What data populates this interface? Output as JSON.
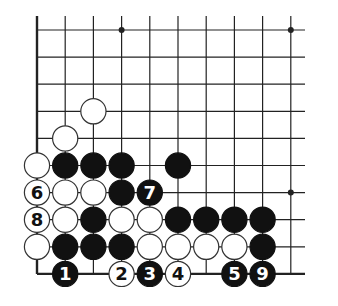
{
  "diagram": {
    "type": "go-board-fragment",
    "columns": 10,
    "rows": 10,
    "edges": {
      "left": true,
      "bottom": true,
      "top": false,
      "right": false
    },
    "star_points": [
      [
        3,
        0
      ],
      [
        9,
        0
      ],
      [
        9,
        6
      ]
    ],
    "stones": [
      {
        "color": "white",
        "col": 2,
        "row": 3,
        "label": ""
      },
      {
        "color": "white",
        "col": 1,
        "row": 4,
        "label": ""
      },
      {
        "color": "white",
        "col": 0,
        "row": 5,
        "label": ""
      },
      {
        "color": "black",
        "col": 1,
        "row": 5,
        "label": ""
      },
      {
        "color": "black",
        "col": 2,
        "row": 5,
        "label": ""
      },
      {
        "color": "black",
        "col": 3,
        "row": 5,
        "label": ""
      },
      {
        "color": "black",
        "col": 5,
        "row": 5,
        "label": ""
      },
      {
        "color": "white",
        "col": 0,
        "row": 6,
        "label": "6"
      },
      {
        "color": "white",
        "col": 1,
        "row": 6,
        "label": ""
      },
      {
        "color": "white",
        "col": 2,
        "row": 6,
        "label": ""
      },
      {
        "color": "black",
        "col": 3,
        "row": 6,
        "label": ""
      },
      {
        "color": "black",
        "col": 4,
        "row": 6,
        "label": "7"
      },
      {
        "color": "white",
        "col": 0,
        "row": 7,
        "label": "8"
      },
      {
        "color": "white",
        "col": 1,
        "row": 7,
        "label": ""
      },
      {
        "color": "black",
        "col": 2,
        "row": 7,
        "label": ""
      },
      {
        "color": "white",
        "col": 3,
        "row": 7,
        "label": ""
      },
      {
        "color": "white",
        "col": 4,
        "row": 7,
        "label": ""
      },
      {
        "color": "black",
        "col": 5,
        "row": 7,
        "label": ""
      },
      {
        "color": "black",
        "col": 6,
        "row": 7,
        "label": ""
      },
      {
        "color": "black",
        "col": 7,
        "row": 7,
        "label": ""
      },
      {
        "color": "black",
        "col": 8,
        "row": 7,
        "label": ""
      },
      {
        "color": "white",
        "col": 0,
        "row": 8,
        "label": ""
      },
      {
        "color": "black",
        "col": 1,
        "row": 8,
        "label": ""
      },
      {
        "color": "black",
        "col": 2,
        "row": 8,
        "label": ""
      },
      {
        "color": "black",
        "col": 3,
        "row": 8,
        "label": ""
      },
      {
        "color": "white",
        "col": 4,
        "row": 8,
        "label": ""
      },
      {
        "color": "white",
        "col": 5,
        "row": 8,
        "label": ""
      },
      {
        "color": "white",
        "col": 6,
        "row": 8,
        "label": ""
      },
      {
        "color": "white",
        "col": 7,
        "row": 8,
        "label": ""
      },
      {
        "color": "black",
        "col": 8,
        "row": 8,
        "label": ""
      },
      {
        "color": "black",
        "col": 1,
        "row": 9,
        "label": "1"
      },
      {
        "color": "white",
        "col": 3,
        "row": 9,
        "label": "2"
      },
      {
        "color": "black",
        "col": 4,
        "row": 9,
        "label": "3"
      },
      {
        "color": "white",
        "col": 5,
        "row": 9,
        "label": "4"
      },
      {
        "color": "black",
        "col": 7,
        "row": 9,
        "label": "5"
      },
      {
        "color": "black",
        "col": 8,
        "row": 9,
        "label": "9"
      }
    ],
    "colors": {
      "line": "#222222",
      "black_stone": "#111111",
      "white_stone": "#ffffff",
      "background": "#ffffff"
    }
  }
}
